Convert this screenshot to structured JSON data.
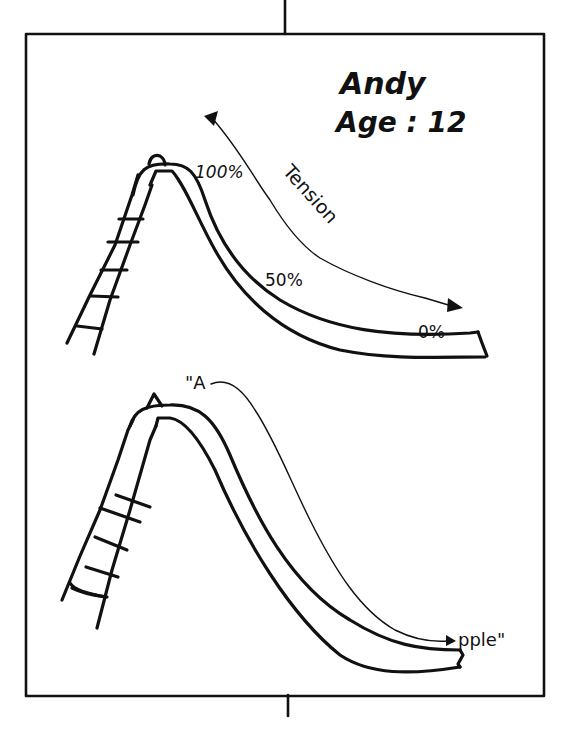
{
  "figure": {
    "style": "hand-drawn sketch, black ink on white",
    "colors": {
      "ink": "#111111",
      "background": "#ffffff"
    }
  },
  "header": {
    "name": "Andy",
    "age_label": "Age : 12"
  },
  "top_slide": {
    "labels": {
      "peak": "100%",
      "middle": "50%",
      "bottom": "0%"
    },
    "arrow_label": "Tension"
  },
  "bottom_slide": {
    "labels": {
      "start": "\"A",
      "end": "pple\""
    }
  },
  "icons": [
    "slide-icon",
    "ladder-icon",
    "double-arrow-icon",
    "arrow-icon"
  ]
}
